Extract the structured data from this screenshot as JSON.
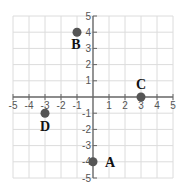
{
  "chart_data": {
    "type": "scatter",
    "title": "",
    "xlabel": "",
    "ylabel": "",
    "xlim": [
      -5,
      5
    ],
    "ylim": [
      -5,
      5
    ],
    "grid": true,
    "x_ticks": [
      -5,
      -4,
      -3,
      -2,
      -1,
      1,
      2,
      3,
      4,
      5
    ],
    "y_ticks": [
      -5,
      -4,
      -3,
      -2,
      -1,
      1,
      2,
      3,
      4,
      5
    ],
    "points": [
      {
        "label": "A",
        "x": 0,
        "y": -4
      },
      {
        "label": "B",
        "x": -1,
        "y": 4
      },
      {
        "label": "C",
        "x": 3,
        "y": 0
      },
      {
        "label": "D",
        "x": -3,
        "y": -1
      }
    ]
  },
  "style": {
    "grid_color": "#dcdcdc",
    "axis_color": "#666666",
    "point_color": "#555555",
    "label_color": "#111111"
  }
}
